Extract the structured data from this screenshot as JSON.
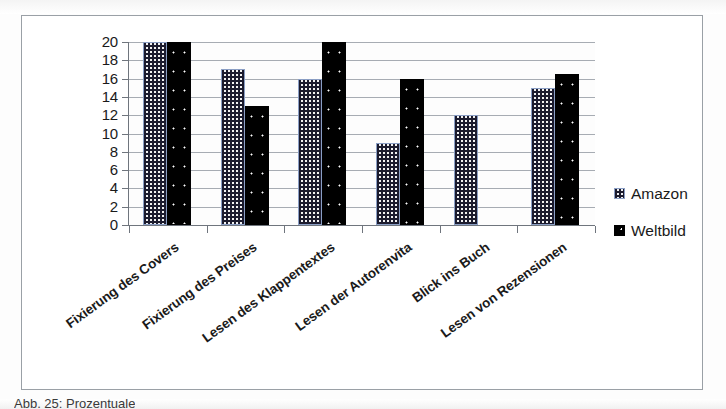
{
  "chart_data": {
    "type": "bar",
    "title": "",
    "xlabel": "",
    "ylabel": "",
    "ylim": [
      0,
      20
    ],
    "ytick_step": 2,
    "grid": true,
    "legend_position": "right",
    "categories": [
      "Fixierung des Covers",
      "Fixierung des Preises",
      "Lesen des Klappentextes",
      "Lesen der Autorenvita",
      "Blick ins Buch",
      "Lesen von Rezensionen"
    ],
    "ytick_labels": [
      "20",
      "18",
      "16",
      "14",
      "12",
      "10",
      "8",
      "6",
      "4",
      "2",
      "0"
    ],
    "series": [
      {
        "name": "Amazon",
        "color": "#eef0f3",
        "pattern": "checkered-dots",
        "values": [
          20,
          17,
          16,
          9,
          12,
          15
        ]
      },
      {
        "name": "Weltbild",
        "color": "#000000",
        "pattern": "solid-black-with-dots",
        "values": [
          20,
          13,
          20,
          16,
          0,
          16.5
        ]
      }
    ]
  },
  "legend": {
    "items": [
      {
        "label": "Amazon",
        "swatch": "amazon-pattern-swatch"
      },
      {
        "label": "Weltbild",
        "swatch": "weltbild-black-swatch"
      }
    ]
  },
  "caption": {
    "text": "Abb. 25: Prozentuale"
  }
}
